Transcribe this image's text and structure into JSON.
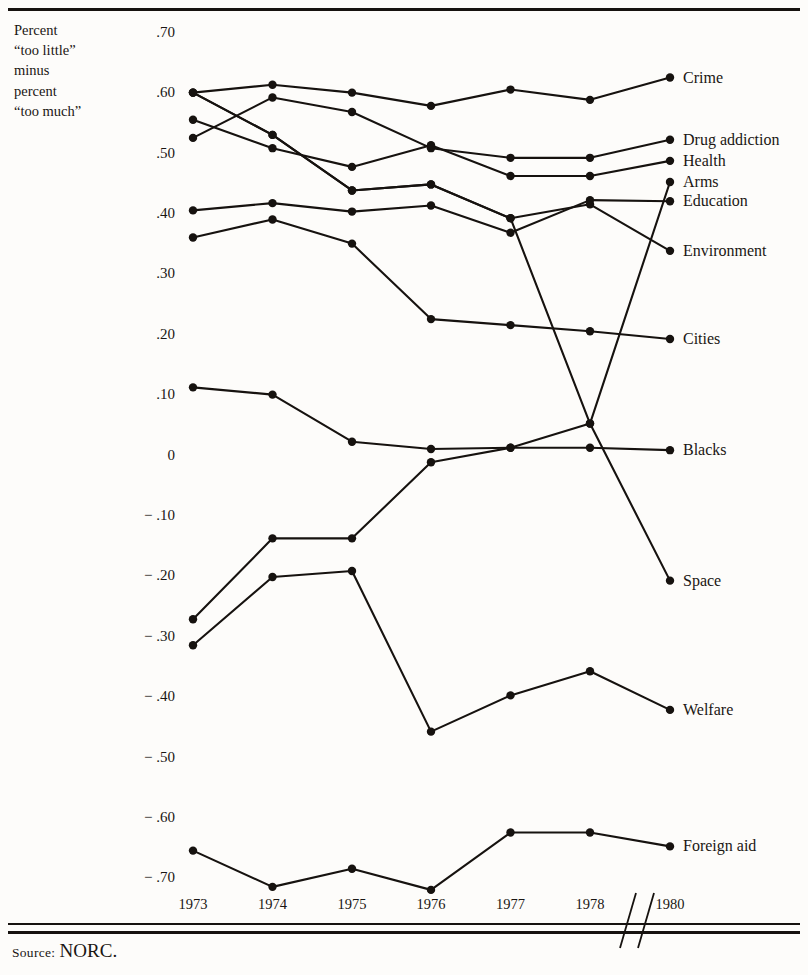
{
  "figure": {
    "axis_caption_lines": [
      "Percent",
      "“too little”",
      "minus",
      "percent",
      "“too much”"
    ],
    "source_prefix": "Source:",
    "source_value": "NORC.",
    "axis_break_marker": "//"
  },
  "chart_data": {
    "type": "line",
    "title": "",
    "subtitle": "",
    "xlabel": "",
    "ylabel": "Percent “too little” minus percent “too much”",
    "x": [
      "1973",
      "1974",
      "1975",
      "1976",
      "1977",
      "1978",
      "1980"
    ],
    "xtick_labels": [
      "1973",
      "1974",
      "1975",
      "1976",
      "1977",
      "1978",
      "1980"
    ],
    "x_axis_break_after": "1978",
    "ytick_labels": [
      ".70",
      ".60",
      ".50",
      ".40",
      ".30",
      ".20",
      ".10",
      "0",
      "− .10",
      "− .20",
      "− .30",
      "− .40",
      "− .50",
      "− .60",
      "− .70"
    ],
    "ytick_values": [
      0.7,
      0.6,
      0.5,
      0.4,
      0.3,
      0.2,
      0.1,
      0,
      -0.1,
      -0.2,
      -0.3,
      -0.4,
      -0.5,
      -0.6,
      -0.7
    ],
    "ylim": [
      -0.75,
      0.72
    ],
    "grid": false,
    "legend_position": "right-inline-endpoint-labels",
    "markers": "filled-circle",
    "series": [
      {
        "name": "Crime",
        "values": [
          0.6,
          0.613,
          0.6,
          0.578,
          0.605,
          0.588,
          0.625
        ]
      },
      {
        "name": "Drug addiction",
        "values": [
          0.525,
          0.592,
          0.568,
          0.508,
          0.492,
          0.492,
          0.522
        ]
      },
      {
        "name": "Health",
        "values": [
          0.555,
          0.508,
          0.477,
          0.513,
          0.462,
          0.462,
          0.487
        ]
      },
      {
        "name": "Arms",
        "values": [
          0.6,
          0.53,
          0.438,
          0.448,
          0.392,
          0.052,
          0.452
        ]
      },
      {
        "name": "Education",
        "values": [
          0.405,
          0.417,
          0.403,
          0.413,
          0.368,
          0.422,
          0.42
        ]
      },
      {
        "name": "Environment",
        "values": [
          0.6,
          0.53,
          0.438,
          0.448,
          0.392,
          0.415,
          0.338
        ]
      },
      {
        "name": "Cities",
        "values": [
          0.36,
          0.39,
          0.35,
          0.225,
          0.215,
          0.205,
          0.192
        ]
      },
      {
        "name": "Blacks",
        "values": [
          0.112,
          0.1,
          0.022,
          0.01,
          0.012,
          0.012,
          0.008
        ]
      },
      {
        "name": "Space",
        "values": [
          -0.272,
          -0.138,
          -0.138,
          -0.012,
          0.012,
          0.052,
          -0.208
        ]
      },
      {
        "name": "Welfare",
        "values": [
          -0.315,
          -0.202,
          -0.192,
          -0.458,
          -0.398,
          -0.358,
          -0.422
        ]
      },
      {
        "name": "Foreign aid",
        "values": [
          -0.655,
          -0.715,
          -0.685,
          -0.72,
          -0.625,
          -0.625,
          -0.648
        ]
      }
    ],
    "series_label_order": [
      "Crime",
      "Drug addiction",
      "Health",
      "Arms",
      "Education",
      "Environment",
      "Cities",
      "Blacks",
      "Space",
      "Welfare",
      "Foreign aid"
    ],
    "ink_color": "#16120f"
  }
}
